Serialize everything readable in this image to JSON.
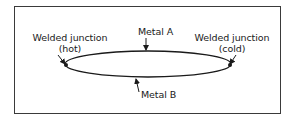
{
  "diagram": {
    "labels": {
      "metal_a": "Metal A",
      "metal_b": "Metal B",
      "hot_junction_line1": "Welded junction",
      "hot_junction_line2": "(hot)",
      "cold_junction_line1": "Welded junction",
      "cold_junction_line2": "(cold)"
    },
    "colors": {
      "stroke": "#1a1a1a",
      "frame": "#3a3a3a",
      "background": "#ffffff"
    }
  }
}
